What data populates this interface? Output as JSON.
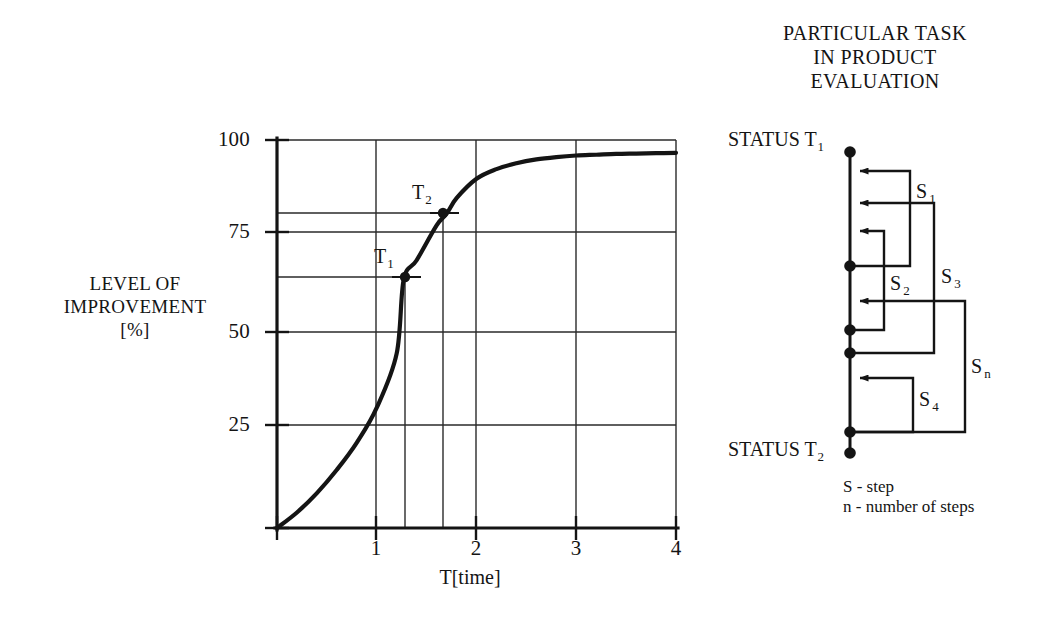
{
  "chart_data": {
    "type": "line",
    "title": "",
    "xlabel": "T[time]",
    "ylabel": "LEVEL OF IMPROVEMENT [%]",
    "ylabel_lines": [
      "LEVEL OF",
      "IMPROVEMENT",
      "[%]"
    ],
    "xlim": [
      0,
      4
    ],
    "ylim": [
      0,
      100
    ],
    "grid": true,
    "legend": "none",
    "xticks": [
      "1",
      "2",
      "3",
      "4"
    ],
    "xtick_values": [
      1,
      2,
      3,
      4
    ],
    "yticks": [
      "25",
      "50",
      "75",
      "100"
    ],
    "ytick_values": [
      25,
      50,
      75,
      100
    ],
    "series": [
      {
        "name": "level of improvement",
        "x": [
          0.0,
          0.2,
          0.4,
          0.6,
          0.8,
          1.0,
          1.2,
          1.27,
          1.4,
          1.6,
          1.7,
          1.8,
          2.0,
          2.2,
          2.4,
          2.6,
          2.8,
          3.0,
          3.2,
          3.4,
          3.6,
          3.8,
          4.0
        ],
        "y": [
          0,
          4,
          9,
          15,
          22,
          31,
          45,
          64,
          69,
          78,
          81,
          85,
          90,
          92.5,
          94,
          95,
          95.6,
          96,
          96.2,
          96.4,
          96.5,
          96.6,
          96.7
        ]
      }
    ],
    "annotations": [
      {
        "label": "T1",
        "label_text": "T",
        "label_sub": "1",
        "x": 1.0,
        "y": 64,
        "marker": "filled-circle",
        "guides": [
          "horizontal-to-axis",
          "vertical-to-axis"
        ]
      },
      {
        "label": "T2",
        "label_text": "T",
        "label_sub": "2",
        "x": 1.4,
        "y": 80,
        "marker": "filled-circle",
        "guides": [
          "horizontal-to-axis",
          "vertical-to-axis"
        ]
      }
    ]
  },
  "diagram": {
    "title_lines": [
      "PARTICULAR TASK",
      "IN PRODUCT",
      "EVALUATION"
    ],
    "status_top": {
      "text": "STATUS  T",
      "sub": "1"
    },
    "status_bottom": {
      "text": "STATUS  T",
      "sub": "2"
    },
    "steps": [
      {
        "text": "S",
        "sub": "1"
      },
      {
        "text": "S",
        "sub": "3"
      },
      {
        "text": "S",
        "sub": "2"
      },
      {
        "text": "S",
        "sub": "n"
      },
      {
        "text": "S",
        "sub": "4"
      }
    ],
    "legend_lines": [
      "S - step",
      "n - number of steps"
    ]
  },
  "colors": {
    "ink": "#141414",
    "grid": "#2a2a2a",
    "background": "#ffffff"
  }
}
